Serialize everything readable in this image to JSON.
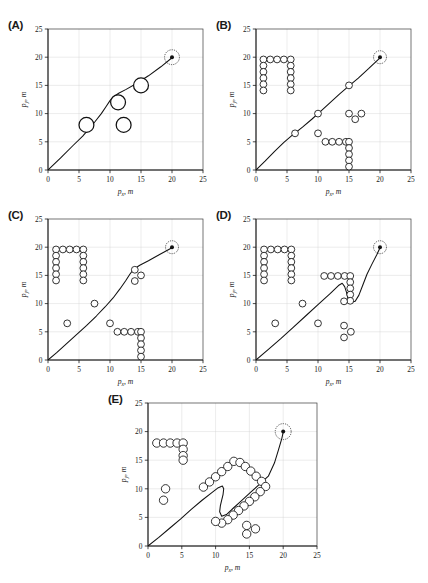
{
  "figure": {
    "axis": {
      "xlabel_sym": "p",
      "xlabel_sub": "x",
      "xlabel_unit": ", m",
      "ylabel_sym": "p",
      "ylabel_sub": "y",
      "ylabel_unit": ", m",
      "ticks": [
        "0",
        "5",
        "10",
        "15",
        "20",
        "25"
      ],
      "xlim": [
        0,
        25
      ],
      "ylim": [
        0,
        25
      ],
      "grid": true
    },
    "colors": {
      "line": "#111111",
      "obstacle_fill": "#ffffff",
      "obstacle_stroke": "#111111",
      "grid": "#cfcfcf",
      "axis": "#1a1a1a"
    },
    "start": [
      0,
      0
    ],
    "goal": [
      20,
      20
    ],
    "goal_marker": "filled-dot-with-dashed-ring"
  },
  "chart_data": [
    {
      "type": "scatter",
      "panel": "A",
      "label": "(A)",
      "title": "",
      "xlabel": "p_x, m",
      "ylabel": "p_y, m",
      "xlim": [
        0,
        25
      ],
      "ylim": [
        0,
        25
      ],
      "xticks": [
        0,
        5,
        10,
        15,
        20,
        25
      ],
      "yticks": [
        0,
        5,
        10,
        15,
        20,
        25
      ],
      "grid": true,
      "obstacle_radius": 1.2,
      "obstacles": [
        [
          6.2,
          8.0
        ],
        [
          11.3,
          12.0
        ],
        [
          12.2,
          8.0
        ],
        [
          15.0,
          15.0
        ]
      ],
      "path": [
        [
          0,
          0
        ],
        [
          2.0,
          2.1
        ],
        [
          4.0,
          4.3
        ],
        [
          5.6,
          6.0
        ],
        [
          6.6,
          7.3
        ],
        [
          7.6,
          8.6
        ],
        [
          8.6,
          10.0
        ],
        [
          9.4,
          11.3
        ],
        [
          10.0,
          12.3
        ],
        [
          10.6,
          13.0
        ],
        [
          11.4,
          13.6
        ],
        [
          12.6,
          14.3
        ],
        [
          14.2,
          15.3
        ],
        [
          16.2,
          16.7
        ],
        [
          18.2,
          18.3
        ],
        [
          20.0,
          19.9
        ]
      ],
      "start": [
        0,
        0
      ],
      "goal": [
        20,
        20
      ]
    },
    {
      "type": "scatter",
      "panel": "B",
      "label": "(B)",
      "xlabel": "p_x, m",
      "ylabel": "p_y, m",
      "xlim": [
        0,
        25
      ],
      "ylim": [
        0,
        25
      ],
      "xticks": [
        0,
        5,
        10,
        15,
        20,
        25
      ],
      "yticks": [
        0,
        5,
        10,
        15,
        20,
        25
      ],
      "grid": true,
      "obstacle_radius": 0.55,
      "obstacles": [
        [
          1.2,
          19.6
        ],
        [
          2.3,
          19.6
        ],
        [
          3.4,
          19.6
        ],
        [
          4.5,
          19.6
        ],
        [
          5.6,
          19.6
        ],
        [
          1.2,
          18.5
        ],
        [
          1.2,
          17.4
        ],
        [
          1.2,
          16.3
        ],
        [
          1.2,
          15.2
        ],
        [
          1.2,
          14.1
        ],
        [
          5.6,
          18.5
        ],
        [
          5.6,
          17.4
        ],
        [
          5.6,
          16.3
        ],
        [
          5.6,
          15.2
        ],
        [
          5.6,
          14.1
        ],
        [
          6.3,
          6.5
        ],
        [
          10.0,
          10.0
        ],
        [
          15.0,
          15.0
        ],
        [
          15.0,
          10.0
        ],
        [
          17.0,
          10.0
        ],
        [
          16.0,
          9.0
        ],
        [
          10.0,
          6.5
        ],
        [
          11.2,
          5.0
        ],
        [
          12.3,
          5.0
        ],
        [
          13.4,
          5.0
        ],
        [
          14.5,
          5.0
        ],
        [
          15.0,
          5.0
        ],
        [
          15.0,
          3.9
        ],
        [
          15.0,
          2.8
        ],
        [
          15.0,
          1.7
        ],
        [
          15.0,
          0.6
        ]
      ],
      "path": [
        [
          0,
          0
        ],
        [
          1.5,
          1.6
        ],
        [
          3.0,
          3.3
        ],
        [
          4.5,
          4.9
        ],
        [
          6.0,
          6.3
        ],
        [
          7.5,
          7.6
        ],
        [
          9.0,
          9.0
        ],
        [
          10.5,
          10.5
        ],
        [
          12.0,
          12.0
        ],
        [
          13.5,
          13.5
        ],
        [
          15.0,
          14.9
        ],
        [
          16.5,
          16.3
        ],
        [
          18.2,
          18.0
        ],
        [
          20.0,
          19.9
        ]
      ]
    },
    {
      "type": "scatter",
      "panel": "C",
      "label": "(C)",
      "xlabel": "p_x, m",
      "ylabel": "p_y, m",
      "xlim": [
        0,
        25
      ],
      "ylim": [
        0,
        25
      ],
      "xticks": [
        0,
        5,
        10,
        15,
        20,
        25
      ],
      "yticks": [
        0,
        5,
        10,
        15,
        20,
        25
      ],
      "grid": true,
      "obstacle_radius": 0.55,
      "obstacles": [
        [
          1.3,
          19.6
        ],
        [
          2.4,
          19.6
        ],
        [
          3.5,
          19.6
        ],
        [
          4.6,
          19.6
        ],
        [
          5.7,
          19.6
        ],
        [
          1.3,
          18.5
        ],
        [
          1.3,
          17.4
        ],
        [
          1.3,
          16.3
        ],
        [
          1.3,
          15.2
        ],
        [
          1.3,
          14.1
        ],
        [
          5.7,
          18.5
        ],
        [
          5.7,
          17.4
        ],
        [
          5.7,
          16.3
        ],
        [
          5.7,
          15.2
        ],
        [
          5.7,
          14.1
        ],
        [
          3.1,
          6.5
        ],
        [
          7.5,
          10.0
        ],
        [
          14.0,
          16.0
        ],
        [
          15.0,
          15.0
        ],
        [
          14.0,
          14.0
        ],
        [
          10.0,
          6.5
        ],
        [
          11.2,
          5.0
        ],
        [
          12.3,
          5.0
        ],
        [
          13.4,
          5.0
        ],
        [
          14.5,
          5.0
        ],
        [
          15.0,
          5.0
        ],
        [
          15.0,
          3.9
        ],
        [
          15.0,
          2.8
        ],
        [
          15.0,
          1.7
        ],
        [
          15.0,
          0.6
        ]
      ],
      "path": [
        [
          0,
          0
        ],
        [
          1.4,
          1.3
        ],
        [
          3.0,
          2.9
        ],
        [
          4.6,
          4.5
        ],
        [
          6.2,
          6.1
        ],
        [
          7.8,
          7.8
        ],
        [
          9.2,
          9.4
        ],
        [
          10.5,
          11.0
        ],
        [
          11.6,
          12.6
        ],
        [
          12.5,
          14.0
        ],
        [
          13.2,
          15.2
        ],
        [
          13.8,
          16.1
        ],
        [
          14.8,
          16.8
        ],
        [
          16.2,
          17.6
        ],
        [
          18.0,
          18.7
        ],
        [
          20.0,
          19.9
        ]
      ]
    },
    {
      "type": "scatter",
      "panel": "D",
      "label": "(D)",
      "xlabel": "p_x, m",
      "ylabel": "p_y, m",
      "xlim": [
        0,
        25
      ],
      "ylim": [
        0,
        25
      ],
      "xticks": [
        0,
        5,
        10,
        15,
        20,
        25
      ],
      "yticks": [
        0,
        5,
        10,
        15,
        20,
        25
      ],
      "grid": true,
      "obstacle_radius": 0.55,
      "obstacles": [
        [
          1.3,
          19.6
        ],
        [
          2.4,
          19.6
        ],
        [
          3.5,
          19.6
        ],
        [
          4.6,
          19.6
        ],
        [
          5.7,
          19.6
        ],
        [
          1.3,
          18.5
        ],
        [
          1.3,
          17.4
        ],
        [
          1.3,
          16.3
        ],
        [
          1.3,
          15.2
        ],
        [
          1.3,
          14.1
        ],
        [
          5.7,
          18.5
        ],
        [
          5.7,
          17.4
        ],
        [
          5.7,
          16.3
        ],
        [
          5.7,
          15.2
        ],
        [
          5.7,
          14.1
        ],
        [
          3.1,
          6.5
        ],
        [
          7.5,
          10.0
        ],
        [
          10.0,
          6.5
        ],
        [
          11.0,
          14.9
        ],
        [
          12.1,
          14.9
        ],
        [
          13.2,
          14.9
        ],
        [
          14.3,
          14.9
        ],
        [
          15.2,
          14.9
        ],
        [
          15.2,
          13.8
        ],
        [
          15.2,
          12.7
        ],
        [
          15.2,
          11.6
        ],
        [
          15.2,
          10.5
        ],
        [
          14.2,
          10.4
        ],
        [
          14.2,
          6.1
        ],
        [
          15.3,
          5.0
        ],
        [
          14.2,
          4.0
        ]
      ],
      "path": [
        [
          0,
          0
        ],
        [
          2.0,
          1.9
        ],
        [
          4.0,
          3.8
        ],
        [
          6.0,
          5.8
        ],
        [
          8.0,
          7.8
        ],
        [
          10.0,
          9.8
        ],
        [
          12.0,
          11.8
        ],
        [
          13.3,
          13.2
        ],
        [
          13.9,
          13.6
        ],
        [
          14.3,
          13.0
        ],
        [
          14.6,
          12.0
        ],
        [
          14.8,
          11.0
        ],
        [
          15.3,
          10.2
        ],
        [
          16.0,
          10.4
        ],
        [
          16.6,
          11.5
        ],
        [
          17.2,
          13.2
        ],
        [
          17.9,
          15.2
        ],
        [
          18.7,
          17.0
        ],
        [
          19.5,
          18.7
        ],
        [
          20.0,
          19.9
        ]
      ]
    },
    {
      "type": "scatter",
      "panel": "E",
      "label": "(E)",
      "xlabel": "p_x, m",
      "ylabel": "p_y, m",
      "xlim": [
        0,
        25
      ],
      "ylim": [
        0,
        25
      ],
      "xticks": [
        0,
        5,
        10,
        15,
        20,
        25
      ],
      "yticks": [
        0,
        5,
        10,
        15,
        20,
        25
      ],
      "grid": true,
      "obstacle_radius": 0.62,
      "obstacles": [
        [
          1.3,
          18.0
        ],
        [
          2.3,
          18.0
        ],
        [
          3.3,
          18.0
        ],
        [
          4.3,
          18.0
        ],
        [
          5.2,
          18.0
        ],
        [
          5.2,
          16.9
        ],
        [
          5.2,
          15.8
        ],
        [
          5.2,
          15.0
        ],
        [
          2.6,
          10.0
        ],
        [
          2.3,
          8.0
        ],
        [
          8.2,
          10.3
        ],
        [
          9.1,
          11.2
        ],
        [
          10.0,
          12.1
        ],
        [
          10.9,
          13.0
        ],
        [
          11.8,
          13.9
        ],
        [
          12.7,
          14.8
        ],
        [
          13.6,
          14.6
        ],
        [
          14.4,
          13.9
        ],
        [
          15.2,
          13.1
        ],
        [
          16.0,
          12.2
        ],
        [
          16.8,
          11.3
        ],
        [
          17.4,
          10.4
        ],
        [
          16.6,
          9.5
        ],
        [
          15.8,
          8.6
        ],
        [
          15.0,
          7.8
        ],
        [
          14.2,
          7.0
        ],
        [
          13.4,
          6.2
        ],
        [
          12.6,
          5.4
        ],
        [
          11.8,
          4.6
        ],
        [
          10.9,
          4.0
        ],
        [
          10.0,
          4.3
        ],
        [
          14.6,
          3.6
        ],
        [
          15.9,
          3.0
        ],
        [
          14.6,
          2.1
        ]
      ],
      "path": [
        [
          0,
          0
        ],
        [
          1.6,
          1.5
        ],
        [
          3.2,
          3.1
        ],
        [
          4.8,
          4.7
        ],
        [
          6.4,
          6.4
        ],
        [
          8.0,
          8.0
        ],
        [
          9.4,
          9.3
        ],
        [
          10.4,
          10.2
        ],
        [
          11.0,
          10.5
        ],
        [
          11.2,
          10.0
        ],
        [
          11.1,
          9.0
        ],
        [
          10.9,
          8.0
        ],
        [
          10.7,
          7.0
        ],
        [
          10.6,
          6.0
        ],
        [
          10.9,
          5.2
        ],
        [
          11.6,
          5.5
        ],
        [
          12.6,
          6.6
        ],
        [
          13.8,
          7.9
        ],
        [
          15.2,
          9.4
        ],
        [
          16.6,
          10.9
        ],
        [
          17.8,
          12.2
        ],
        [
          18.7,
          14.5
        ],
        [
          19.3,
          16.8
        ],
        [
          19.8,
          18.8
        ],
        [
          20.0,
          19.9
        ]
      ]
    }
  ]
}
